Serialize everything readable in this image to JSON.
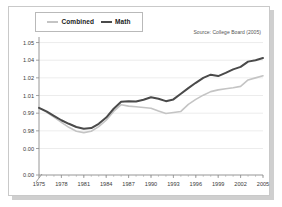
{
  "figure": {
    "source_note": "Source: College Board (2005)",
    "frame_shadow_color": "#cfcfcf",
    "background_color": "#ffffff"
  },
  "legend": {
    "position": "top-left",
    "items": [
      {
        "label": "Combined",
        "color": "#c4c4c4",
        "icon": "line-swatch-icon"
      },
      {
        "label": "Math",
        "color": "#4a4a4a",
        "icon": "line-swatch-icon"
      }
    ]
  },
  "chart_data": {
    "type": "line",
    "title": "",
    "subtitle": "",
    "xlabel": "",
    "ylabel": "",
    "source": "Source: College Board (2005)",
    "grid": true,
    "axis_break": true,
    "xlim": [
      1975,
      2005
    ],
    "ylim": [
      0.975,
      1.052
    ],
    "ytick_labels": [
      "1.05",
      "1.04",
      "1.02",
      "1.01",
      "0.99",
      "0.98",
      "0.00"
    ],
    "ytick_values": [
      1.05,
      1.04,
      1.03,
      1.02,
      1.01,
      1.0,
      0.99
    ],
    "ytick_display": [
      {
        "label": "1.05",
        "value": 1.05
      },
      {
        "label": "1.04",
        "value": 1.04
      },
      {
        "label": "1.02",
        "value": 1.03
      },
      {
        "label": "1.01",
        "value": 1.02
      },
      {
        "label": "0.99",
        "value": 1.01
      },
      {
        "label": "0.98",
        "value": 1.0
      },
      {
        "label": "0.00",
        "value": 0.99
      }
    ],
    "xtick_labels": [
      "1975",
      "1978",
      "1981",
      "1984",
      "1987",
      "1990",
      "1993",
      "1996",
      "1999",
      "2002",
      "2005"
    ],
    "xtick_values": [
      1975,
      1978,
      1981,
      1984,
      1987,
      1990,
      1993,
      1996,
      1999,
      2002,
      2005
    ],
    "x": [
      1975,
      1976,
      1977,
      1978,
      1979,
      1980,
      1981,
      1982,
      1983,
      1984,
      1985,
      1986,
      1987,
      1988,
      1989,
      1990,
      1991,
      1992,
      1993,
      1994,
      1995,
      1996,
      1997,
      1998,
      1999,
      2000,
      2001,
      2002,
      2003,
      2004,
      2005
    ],
    "series": [
      {
        "name": "Math",
        "color": "#4a4a4a",
        "values": [
          1.013,
          1.011,
          1.0085,
          1.006,
          1.004,
          1.0022,
          1.0012,
          1.0016,
          1.004,
          1.0075,
          1.0125,
          1.0165,
          1.0168,
          1.0166,
          1.0176,
          1.019,
          1.0182,
          1.0168,
          1.0178,
          1.021,
          1.0242,
          1.0272,
          1.03,
          1.0318,
          1.031,
          1.0328,
          1.0348,
          1.0362,
          1.0392,
          1.04,
          1.0412
        ]
      },
      {
        "name": "Combined",
        "color": "#c4c4c4",
        "values": [
          1.013,
          1.0106,
          1.0078,
          1.0048,
          1.002,
          0.9998,
          0.999,
          0.9998,
          1.0024,
          1.006,
          1.011,
          1.0148,
          1.014,
          1.0136,
          1.0132,
          1.0128,
          1.0112,
          1.0098,
          1.0104,
          1.011,
          1.015,
          1.0178,
          1.0202,
          1.0222,
          1.0232,
          1.0238,
          1.0244,
          1.0252,
          1.0288,
          1.03,
          1.0312
        ]
      }
    ]
  }
}
